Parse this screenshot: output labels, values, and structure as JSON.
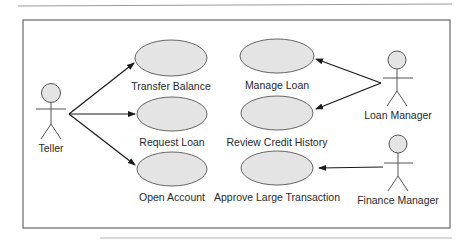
{
  "diagram": {
    "type": "use-case",
    "actors": [
      {
        "id": "teller",
        "label": "Teller"
      },
      {
        "id": "loan_manager",
        "label": "Loan Manager"
      },
      {
        "id": "finance_manager",
        "label": "Finance Manager"
      }
    ],
    "use_cases": [
      {
        "id": "transfer_balance",
        "label": "Transfer Balance"
      },
      {
        "id": "request_loan",
        "label": "Request Loan"
      },
      {
        "id": "open_account",
        "label": "Open Account"
      },
      {
        "id": "manage_loan",
        "label": "Manage Loan"
      },
      {
        "id": "review_credit_history",
        "label": "Review Credit History"
      },
      {
        "id": "approve_large_transaction",
        "label": "Approve Large Transaction"
      }
    ],
    "associations": [
      {
        "from": "teller",
        "to": "transfer_balance"
      },
      {
        "from": "teller",
        "to": "request_loan"
      },
      {
        "from": "teller",
        "to": "open_account"
      },
      {
        "from": "loan_manager",
        "to": "manage_loan"
      },
      {
        "from": "loan_manager",
        "to": "review_credit_history"
      },
      {
        "from": "finance_manager",
        "to": "approve_large_transaction"
      }
    ],
    "colors": {
      "ellipse_fill": "#e4e4e4",
      "stroke": "#555555",
      "arrow": "#1a1a1a"
    }
  }
}
